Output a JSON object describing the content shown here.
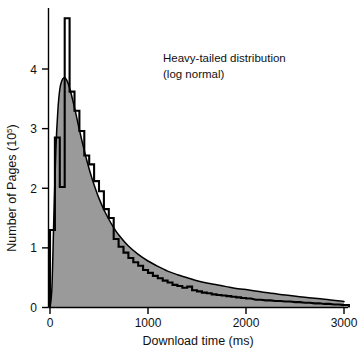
{
  "chart_data": {
    "type": "area",
    "title": "",
    "annotation": [
      "Heavy-tailed distribution",
      "(log normal)"
    ],
    "xlabel": "Download time (ms)",
    "ylabel_main": "Number of Pages (10",
    "ylabel_exponent": "5",
    "ylabel_tail": ")",
    "xlim": [
      0,
      3000
    ],
    "ylim": [
      0,
      4.85
    ],
    "grid": false,
    "legend": "none",
    "xticks": [
      0,
      1000,
      2000,
      3000
    ],
    "xtick_labels": [
      "0",
      "1000",
      "2000",
      "3000"
    ],
    "yticks": [
      0,
      1,
      2,
      3,
      4
    ],
    "ytick_labels": [
      "0",
      "1",
      "2",
      "3",
      "4"
    ],
    "colors": {
      "fill": "#9a9a9a",
      "line": "#000000",
      "axis": "#000000",
      "background": "#ffffff"
    },
    "series": [
      {
        "name": "Log-normal fit (smooth curve)",
        "type": "line",
        "x": [
          0,
          20,
          40,
          60,
          80,
          100,
          120,
          140,
          160,
          180,
          200,
          220,
          240,
          260,
          280,
          300,
          340,
          380,
          420,
          460,
          500,
          550,
          600,
          650,
          700,
          800,
          900,
          1000,
          1100,
          1200,
          1300,
          1400,
          1500,
          1600,
          1700,
          1800,
          1900,
          2000,
          2200,
          2400,
          2600,
          2800,
          3000
        ],
        "y": [
          0.0,
          0.35,
          1.55,
          2.65,
          3.3,
          3.66,
          3.8,
          3.85,
          3.84,
          3.78,
          3.68,
          3.56,
          3.42,
          3.28,
          3.13,
          2.98,
          2.7,
          2.44,
          2.21,
          2.01,
          1.83,
          1.64,
          1.48,
          1.34,
          1.22,
          1.03,
          0.89,
          0.78,
          0.69,
          0.61,
          0.55,
          0.5,
          0.45,
          0.41,
          0.38,
          0.35,
          0.32,
          0.3,
          0.25,
          0.21,
          0.17,
          0.14,
          0.1
        ]
      },
      {
        "name": "Measured histogram (staircase)",
        "type": "step",
        "bin_width": 50,
        "bin_starts": [
          0,
          50,
          100,
          150,
          200,
          250,
          300,
          350,
          400,
          450,
          500,
          550,
          600,
          650,
          700,
          750,
          800,
          850,
          900,
          950,
          1000,
          1050,
          1100,
          1150,
          1200,
          1250,
          1300,
          1350,
          1400,
          1450,
          1500,
          1550,
          1600,
          1650,
          1700,
          1750,
          1800,
          1850,
          1900,
          1950,
          2000,
          2100,
          2200,
          2300,
          2400,
          2500,
          2600,
          2700,
          2800,
          2900,
          3000
        ],
        "values": [
          1.3,
          2.85,
          2.02,
          4.85,
          3.62,
          3.3,
          2.96,
          2.55,
          2.4,
          2.12,
          1.95,
          1.65,
          1.5,
          1.15,
          1.02,
          0.92,
          0.83,
          0.76,
          0.7,
          0.63,
          0.58,
          0.53,
          0.49,
          0.45,
          0.42,
          0.38,
          0.36,
          0.33,
          0.35,
          0.29,
          0.27,
          0.25,
          0.24,
          0.22,
          0.21,
          0.2,
          0.19,
          0.18,
          0.17,
          0.16,
          0.15,
          0.13,
          0.12,
          0.11,
          0.1,
          0.09,
          0.08,
          0.07,
          0.06,
          0.05,
          0.04
        ],
        "notes": "Tall narrow spike at ~200 ms is clipped by the top of the plot; a deep notch drops to ~2.0 near 100-150 ms."
      }
    ]
  }
}
